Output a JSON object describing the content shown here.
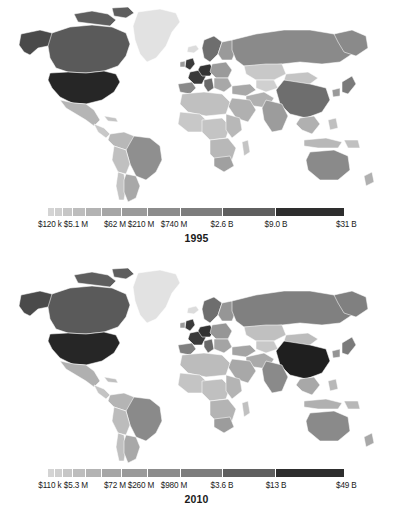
{
  "figure": {
    "type": "choropleth-map-pair",
    "panels": [
      {
        "id": "1995",
        "year_label": "1995",
        "legend": {
          "labels": [
            "$120 k",
            "$5.1 M",
            "$62 M",
            "$210 M",
            "$740 M",
            "$2.6 B",
            "$9.0 B",
            "$31 B"
          ],
          "label_positions_pct": [
            0,
            9.3,
            22.3,
            31.0,
            42.0,
            58.0,
            76.0,
            100
          ],
          "segments": [
            {
              "width_pct": 2.0,
              "color": "#d4d4d4"
            },
            {
              "width_pct": 2.4,
              "color": "#cfcfcf"
            },
            {
              "width_pct": 3.0,
              "color": "#c6c6c6"
            },
            {
              "width_pct": 3.9,
              "color": "#bdbdbd"
            },
            {
              "width_pct": 5.0,
              "color": "#b3b3b3"
            },
            {
              "width_pct": 6.4,
              "color": "#a6a6a6"
            },
            {
              "width_pct": 8.3,
              "color": "#9a9a9a"
            },
            {
              "width_pct": 10.6,
              "color": "#8c8c8c"
            },
            {
              "width_pct": 13.6,
              "color": "#7d7d7d"
            },
            {
              "width_pct": 17.5,
              "color": "#5f5f5f"
            },
            {
              "width_pct": 22.5,
              "color": "#2e2e2e"
            }
          ]
        }
      },
      {
        "id": "2010",
        "year_label": "2010",
        "legend": {
          "labels": [
            "$110 k",
            "$5.3 M",
            "$72 M",
            "$260 M",
            "$980 M",
            "$3.6 B",
            "$13 B",
            "$49 B"
          ],
          "label_positions_pct": [
            0,
            9.3,
            22.3,
            31.0,
            42.0,
            58.0,
            76.0,
            100
          ],
          "segments": [
            {
              "width_pct": 2.0,
              "color": "#d4d4d4"
            },
            {
              "width_pct": 2.4,
              "color": "#cfcfcf"
            },
            {
              "width_pct": 3.0,
              "color": "#c6c6c6"
            },
            {
              "width_pct": 3.9,
              "color": "#bdbdbd"
            },
            {
              "width_pct": 5.0,
              "color": "#b3b3b3"
            },
            {
              "width_pct": 6.4,
              "color": "#a6a6a6"
            },
            {
              "width_pct": 8.3,
              "color": "#9a9a9a"
            },
            {
              "width_pct": 10.6,
              "color": "#8c8c8c"
            },
            {
              "width_pct": 13.6,
              "color": "#7d7d7d"
            },
            {
              "width_pct": 17.5,
              "color": "#5f5f5f"
            },
            {
              "width_pct": 22.5,
              "color": "#2e2e2e"
            }
          ]
        }
      }
    ]
  },
  "chart_data": {
    "type": "heatmap",
    "subtype": "choropleth world map, grayscale, logarithmic color scale",
    "title": "",
    "panels": [
      {
        "year": "1995",
        "legend_ticks": [
          "$120 k",
          "$5.1 M",
          "$62 M",
          "$210 M",
          "$740 M",
          "$2.6 B",
          "$9.0 B",
          "$31 B"
        ],
        "scale_min": "$120 k",
        "scale_max": "$31 B",
        "countries": [
          {
            "name": "United States",
            "shade": "#262626",
            "level": 11
          },
          {
            "name": "Canada",
            "shade": "#5a5a5a",
            "level": 10
          },
          {
            "name": "Mexico",
            "shade": "#b5b5b5",
            "level": 5
          },
          {
            "name": "Brazil",
            "shade": "#8f8f8f",
            "level": 8
          },
          {
            "name": "Argentina",
            "shade": "#a8a8a8",
            "level": 6
          },
          {
            "name": "Greenland",
            "shade": "#e2e2e2",
            "level": 1
          },
          {
            "name": "United Kingdom",
            "shade": "#3a3a3a",
            "level": 11
          },
          {
            "name": "France",
            "shade": "#3a3a3a",
            "level": 11
          },
          {
            "name": "Germany",
            "shade": "#333333",
            "level": 11
          },
          {
            "name": "Spain",
            "shade": "#8a8a8a",
            "level": 8
          },
          {
            "name": "Italy",
            "shade": "#6a6a6a",
            "level": 9
          },
          {
            "name": "Russia",
            "shade": "#8a8a8a",
            "level": 8
          },
          {
            "name": "China",
            "shade": "#6e6e6e",
            "level": 9
          },
          {
            "name": "India",
            "shade": "#9c9c9c",
            "level": 7
          },
          {
            "name": "Japan",
            "shade": "#7a7a7a",
            "level": 9
          },
          {
            "name": "Australia",
            "shade": "#8a8a8a",
            "level": 8
          },
          {
            "name": "South Africa",
            "shade": "#a0a0a0",
            "level": 7
          },
          {
            "name": "Kazakhstan",
            "shade": "#c8c8c8",
            "level": 3
          },
          {
            "name": "Saudi Arabia",
            "shade": "#b0b0b0",
            "level": 5
          }
        ]
      },
      {
        "year": "2010",
        "legend_ticks": [
          "$110 k",
          "$5.3 M",
          "$72 M",
          "$260 M",
          "$980 M",
          "$3.6 B",
          "$13 B",
          "$49 B"
        ],
        "scale_min": "$110 k",
        "scale_max": "$49 B",
        "countries": [
          {
            "name": "United States",
            "shade": "#262626",
            "level": 11
          },
          {
            "name": "Canada",
            "shade": "#5a5a5a",
            "level": 10
          },
          {
            "name": "Mexico",
            "shade": "#b0b0b0",
            "level": 5
          },
          {
            "name": "Brazil",
            "shade": "#8a8a8a",
            "level": 8
          },
          {
            "name": "Argentina",
            "shade": "#a8a8a8",
            "level": 6
          },
          {
            "name": "Greenland",
            "shade": "#e2e2e2",
            "level": 1
          },
          {
            "name": "United Kingdom",
            "shade": "#3a3a3a",
            "level": 11
          },
          {
            "name": "France",
            "shade": "#3a3a3a",
            "level": 11
          },
          {
            "name": "Germany",
            "shade": "#333333",
            "level": 11
          },
          {
            "name": "Spain",
            "shade": "#808080",
            "level": 8
          },
          {
            "name": "Italy",
            "shade": "#6a6a6a",
            "level": 9
          },
          {
            "name": "Russia",
            "shade": "#808080",
            "level": 8
          },
          {
            "name": "China",
            "shade": "#1f1f1f",
            "level": 11
          },
          {
            "name": "India",
            "shade": "#8a8a8a",
            "level": 8
          },
          {
            "name": "Japan",
            "shade": "#7a7a7a",
            "level": 9
          },
          {
            "name": "Australia",
            "shade": "#8a8a8a",
            "level": 8
          },
          {
            "name": "South Africa",
            "shade": "#9c9c9c",
            "level": 7
          },
          {
            "name": "Kazakhstan",
            "shade": "#c0c0c0",
            "level": 4
          },
          {
            "name": "Saudi Arabia",
            "shade": "#a8a8a8",
            "level": 6
          }
        ]
      }
    ]
  }
}
